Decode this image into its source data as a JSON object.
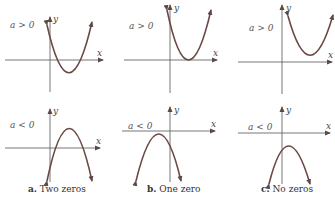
{
  "figure": {
    "columns": [
      {
        "id": "a",
        "caption_letter": "a.",
        "caption_text": " Two zeros",
        "top": {
          "condition": "a > 0",
          "y_label": "y",
          "x_label": "x",
          "zeros": 2
        },
        "bottom": {
          "condition": "a < 0",
          "y_label": "y",
          "x_label": "x",
          "zeros": 2
        }
      },
      {
        "id": "b",
        "caption_letter": "b.",
        "caption_text": " One zero",
        "top": {
          "condition": "a > 0",
          "y_label": "y",
          "x_label": "x",
          "zeros": 1
        },
        "bottom": {
          "condition": "a < 0",
          "y_label": "y",
          "x_label": "x",
          "zeros": 1
        }
      },
      {
        "id": "c",
        "caption_letter": "c.",
        "caption_text": " No zeros",
        "top": {
          "condition": "a > 0",
          "y_label": "y",
          "x_label": "x",
          "zeros": 0
        },
        "bottom": {
          "condition": "a < 0",
          "y_label": "y",
          "x_label": "x",
          "zeros": 0
        }
      }
    ]
  }
}
